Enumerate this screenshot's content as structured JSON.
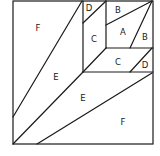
{
  "diagram": {
    "title": "",
    "labels": [
      {
        "id": "F1",
        "text": "F",
        "x": 38,
        "y": 28
      },
      {
        "id": "D1",
        "text": "D",
        "x": 89,
        "y": 8
      },
      {
        "id": "B1",
        "text": "B",
        "x": 118,
        "y": 10
      },
      {
        "id": "A1",
        "text": "A",
        "x": 123,
        "y": 32
      },
      {
        "id": "B2",
        "text": "B",
        "x": 145,
        "y": 37
      },
      {
        "id": "C1",
        "text": "C",
        "x": 94,
        "y": 39
      },
      {
        "id": "C2",
        "text": "C",
        "x": 118,
        "y": 62
      },
      {
        "id": "D2",
        "text": "D",
        "x": 145,
        "y": 65
      },
      {
        "id": "E1",
        "text": "E",
        "x": 56,
        "y": 77
      },
      {
        "id": "E2",
        "text": "E",
        "x": 83,
        "y": 98
      },
      {
        "id": "F2",
        "text": "F",
        "x": 123,
        "y": 122
      }
    ],
    "line_color": "#1a1a1a"
  }
}
